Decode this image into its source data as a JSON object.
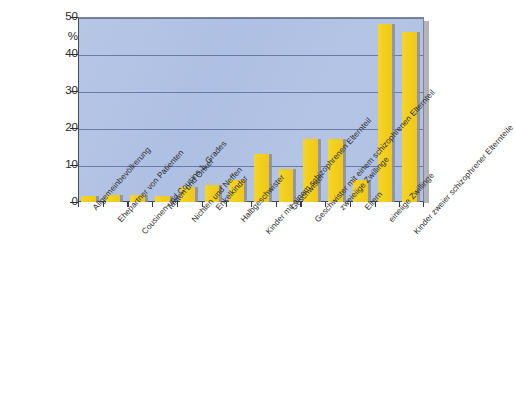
{
  "chart_data": {
    "type": "bar",
    "title": "",
    "subtitle": "",
    "xlabel": "",
    "ylabel": "%",
    "ylim": [
      0,
      50
    ],
    "yticks": [
      0,
      10,
      20,
      30,
      40,
      50
    ],
    "ytick_labels": [
      "0",
      "10",
      "20",
      "30",
      "40",
      "50"
    ],
    "y_unit_label": "%",
    "grid": "horizontal",
    "legend": "none",
    "bar_color": "#f2cd1f",
    "plot_background": "#aec0e3",
    "categories": [
      "Allgemeinbevölkerung",
      "Ehepartner von Patienten",
      "Cousinen und Cousins 1. Grades",
      "Tanten und Onkel",
      "Nichten und Neffen",
      "Enkelkinder",
      "Halbgeschwister",
      "Kinder mit einem schizophrenen Elternteil",
      "Geschwister",
      "Geschwister mit einem schizophrenen Elternteil",
      "zweieiige Zwillinge",
      "Eltern",
      "eineiige Zwillinge",
      "Kinder zweier schizophrener Elternteile"
    ],
    "values": [
      1.5,
      2,
      2,
      1.5,
      4,
      4.5,
      6,
      13,
      9,
      17,
      17,
      6,
      48,
      46
    ]
  },
  "caption": {
    "text": ""
  }
}
